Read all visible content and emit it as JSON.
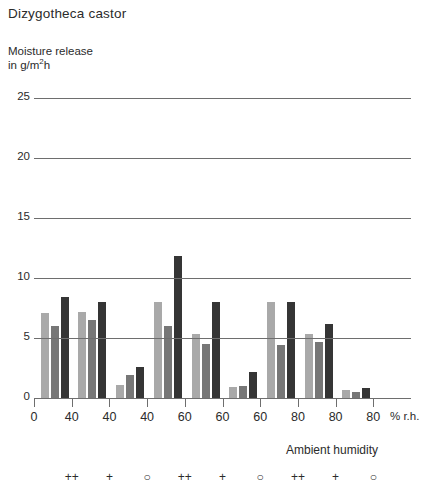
{
  "chart_data": {
    "type": "bar",
    "title": "Dizygotheca castor",
    "ylabel_line1": "Moisture release",
    "ylabel_line2_pre": "in g/m",
    "ylabel_line2_sup": "2",
    "ylabel_line2_post": "h",
    "xlabel": "Ambient humidity",
    "xunit": "% r.h.",
    "ylim": [
      0,
      25
    ],
    "yticks": [
      0,
      5,
      10,
      15,
      20,
      25
    ],
    "ytick_labels": [
      "0",
      "5",
      "10",
      "15",
      "20",
      "25"
    ],
    "xtick_labels": [
      "0",
      "40",
      "40",
      "40",
      "60",
      "60",
      "60",
      "80",
      "80",
      "80"
    ],
    "group_symbols": [
      "",
      "++",
      "+",
      "○",
      "++",
      "+",
      "○",
      "++",
      "+",
      "○"
    ],
    "grid": true,
    "legend": "none",
    "series": [
      {
        "name": "light-gray",
        "color": "#a9a9a9",
        "values": [
          7.1,
          7.2,
          1.1,
          8.0,
          5.3,
          0.9,
          8.0,
          5.3,
          0.7
        ]
      },
      {
        "name": "medium-gray",
        "color": "#777777",
        "values": [
          6.0,
          6.5,
          1.9,
          6.0,
          4.5,
          1.0,
          4.4,
          4.7,
          0.5
        ]
      },
      {
        "name": "dark-gray",
        "color": "#353535",
        "values": [
          8.4,
          8.0,
          2.6,
          11.8,
          8.0,
          2.2,
          8.0,
          6.2,
          0.8
        ]
      }
    ],
    "group_labels": [
      "40 ++",
      "40 +",
      "40 ○",
      "60 ++",
      "60 +",
      "60 ○",
      "80 ++",
      "80 +",
      "80 ○"
    ]
  }
}
